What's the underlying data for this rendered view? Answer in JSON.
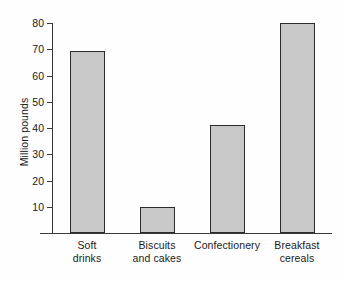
{
  "chart_data": {
    "type": "bar",
    "title": "",
    "subtitle": "",
    "xlabel": "",
    "ylabel": "Million pounds",
    "categories": [
      "Soft drinks",
      "Biscuits and cakes",
      "Confectionery",
      "Breakfast cereals"
    ],
    "category_lines": [
      [
        "Soft",
        "drinks"
      ],
      [
        "Biscuits",
        "and cakes"
      ],
      [
        "Confectionery",
        ""
      ],
      [
        "Breakfast",
        "cereals"
      ]
    ],
    "values": [
      69.5,
      10,
      41,
      80
    ],
    "ylim": [
      0,
      80
    ],
    "y_ticks": [
      10,
      20,
      30,
      40,
      50,
      60,
      70,
      80
    ],
    "y_tick_labels": [
      "10",
      "20",
      "30",
      "40",
      "50",
      "60",
      "70",
      "80"
    ],
    "grid": false,
    "legend": "none",
    "bar_fill_color": "#c8c8c8",
    "bar_border_color": "#2b2b2b",
    "axis_color": "#3a3a3a",
    "background_color": "#fefefe"
  }
}
